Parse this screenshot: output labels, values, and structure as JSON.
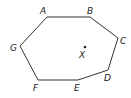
{
  "figure": {
    "type": "heptagon",
    "vertices": [
      "A",
      "B",
      "C",
      "D",
      "E",
      "F",
      "G"
    ],
    "interior_point": "X"
  },
  "labels": {
    "A": "A",
    "B": "B",
    "C": "C",
    "D": "D",
    "E": "E",
    "F": "F",
    "G": "G",
    "X": "X"
  },
  "colors": {
    "stroke": "#333333",
    "text": "#222222",
    "background": "#ffffff"
  }
}
